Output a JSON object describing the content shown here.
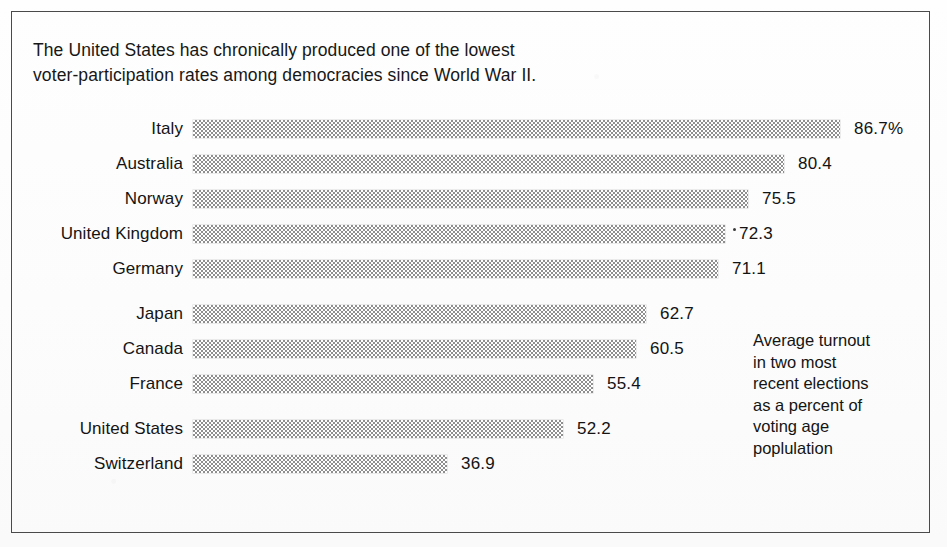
{
  "figure": {
    "title_lines": [
      "The United States has chronically produced one of the lowest",
      "voter-participation rates among democracies since World War II."
    ],
    "note_lines": [
      "Average turnout",
      "in two most",
      "recent elections",
      "as a percent of",
      "voting age",
      "poplulation"
    ],
    "colors": {
      "bar_fill": "#8f8f8f",
      "text": "#141414",
      "frame": "#4a4a4a",
      "background": "#fdfdfd"
    }
  },
  "chart_data": {
    "type": "bar",
    "orientation": "horizontal",
    "title": "The United States has chronically produced one of the lowest voter-participation rates among democracies since World War II.",
    "xlabel": "",
    "ylabel": "",
    "grid": false,
    "legend": "none",
    "annotation": "Average turnout in two most recent elections as a percent of voting age poplulation",
    "categories": [
      "Italy",
      "Australia",
      "Norway",
      "United Kingdom",
      "Germany",
      "Japan",
      "Canada",
      "France",
      "United States",
      "Switzerland"
    ],
    "values": [
      86.7,
      80.4,
      75.5,
      72.3,
      71.1,
      62.7,
      60.5,
      55.4,
      52.2,
      36.9
    ],
    "value_labels": [
      "86.7%",
      "80.4",
      "75.5",
      "72.3",
      "71.1",
      "62.7",
      "60.5",
      "55.4",
      "52.2",
      "36.9"
    ],
    "bar_pixel_ends": [
      840,
      784,
      748,
      725,
      718,
      646,
      636,
      593,
      563,
      447
    ],
    "bar_pixel_start": 193,
    "row_tops": [
      118,
      153,
      188,
      223,
      258,
      303,
      338,
      373,
      418,
      453
    ],
    "units": "percent of voting age population"
  }
}
